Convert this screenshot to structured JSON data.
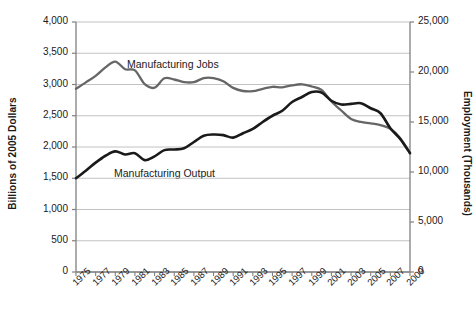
{
  "chart_data": {
    "type": "line",
    "title": "",
    "xlabel": "",
    "ylabel": "Billions of 2005 Dollars",
    "y2label": "Employment (Thousands)",
    "ylim": [
      0,
      4000
    ],
    "y2lim": [
      0,
      25000
    ],
    "xlim": [
      1975,
      2009
    ],
    "grid": true,
    "legend_position": "inline-annotation",
    "y_ticks": [
      "0",
      "500",
      "1,000",
      "1,500",
      "2,000",
      "2,500",
      "3,000",
      "3,500",
      "4,000"
    ],
    "y_tick_values": [
      0,
      500,
      1000,
      1500,
      2000,
      2500,
      3000,
      3500,
      4000
    ],
    "y2_ticks": [
      "0",
      "5,000",
      "10,000",
      "15,000",
      "20,000",
      "25,000"
    ],
    "y2_tick_values": [
      0,
      5000,
      10000,
      15000,
      20000,
      25000
    ],
    "x_ticks": [
      "1975",
      "1977",
      "1979",
      "1981",
      "1983",
      "1985",
      "1987",
      "1989",
      "1991",
      "1993",
      "1995",
      "1997",
      "1999",
      "2001",
      "2003",
      "2005",
      "2007",
      "2009"
    ],
    "x": [
      1975,
      1976,
      1977,
      1978,
      1979,
      1980,
      1981,
      1982,
      1983,
      1984,
      1985,
      1986,
      1987,
      1988,
      1989,
      1990,
      1991,
      1992,
      1993,
      1994,
      1995,
      1996,
      1997,
      1998,
      1999,
      2000,
      2001,
      2002,
      2003,
      2004,
      2005,
      2006,
      2007,
      2008,
      2009
    ],
    "series": [
      {
        "name": "Manufacturing Jobs",
        "axis": "right",
        "units": "thousands of employees",
        "color": "#666666",
        "values": [
          18320,
          18960,
          19620,
          20460,
          21040,
          20280,
          20170,
          18780,
          18430,
          19370,
          19250,
          18990,
          18990,
          19390,
          19390,
          19080,
          18410,
          18100,
          18080,
          18320,
          18520,
          18470,
          18670,
          18770,
          18550,
          18200,
          17050,
          16150,
          15310,
          15010,
          14870,
          14690,
          14330,
          13390,
          11900
        ]
      },
      {
        "name": "Manufacturing Output",
        "axis": "left",
        "units": "billions of 2005 dollars",
        "color": "#1a1a1a",
        "values": [
          1500,
          1620,
          1750,
          1860,
          1930,
          1880,
          1900,
          1790,
          1850,
          1950,
          1960,
          1980,
          2080,
          2180,
          2200,
          2190,
          2150,
          2220,
          2290,
          2400,
          2500,
          2580,
          2720,
          2800,
          2880,
          2870,
          2740,
          2680,
          2690,
          2700,
          2620,
          2540,
          2300,
          2130,
          1900
        ]
      }
    ],
    "annotations": [
      {
        "text": "Manufacturing Jobs",
        "x": 1982,
        "y": 21800
      },
      {
        "text": "Manufacturing Output",
        "x": 1980,
        "y": 1490
      }
    ]
  },
  "colors": {
    "jobs_line": "#666666",
    "output_line": "#1a1a1a",
    "grid": "#b3b3b3",
    "axis": "#808080",
    "background": "#ffffff"
  }
}
